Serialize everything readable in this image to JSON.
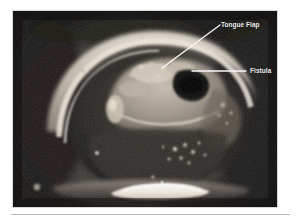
{
  "figure": {
    "name": "intraoral-clinical-photograph",
    "modality": "clinical photograph",
    "color_mode": "grayscale"
  },
  "photo": {
    "frame": {
      "x": 13,
      "y": 11,
      "width": 264,
      "height": 196
    },
    "background_hex": "#1a1a1a",
    "highlight_hex": "#f0ece4",
    "midtone_hex": "#9a9288",
    "shadow_hex": "#141414"
  },
  "annotations": [
    {
      "id": "tongue-flap",
      "label": "Tongue Flap",
      "color_hex": "#f2f2f2",
      "label_x": 221,
      "label_y": 21.5,
      "leader": {
        "type": "diagonal",
        "x1": 220,
        "y1": 25,
        "x2": 162,
        "y2": 68
      }
    },
    {
      "id": "fistula",
      "label": "Fistula",
      "color_hex": "#f2f2f2",
      "label_x": 250,
      "label_y": 67.5,
      "leader": {
        "type": "horizontal",
        "x1": 246,
        "y1": 71,
        "x2": 192,
        "y2": 71
      }
    }
  ],
  "rule": {
    "x": 11,
    "y": 214,
    "width": 279,
    "color_hex": "#b9b9b9"
  }
}
